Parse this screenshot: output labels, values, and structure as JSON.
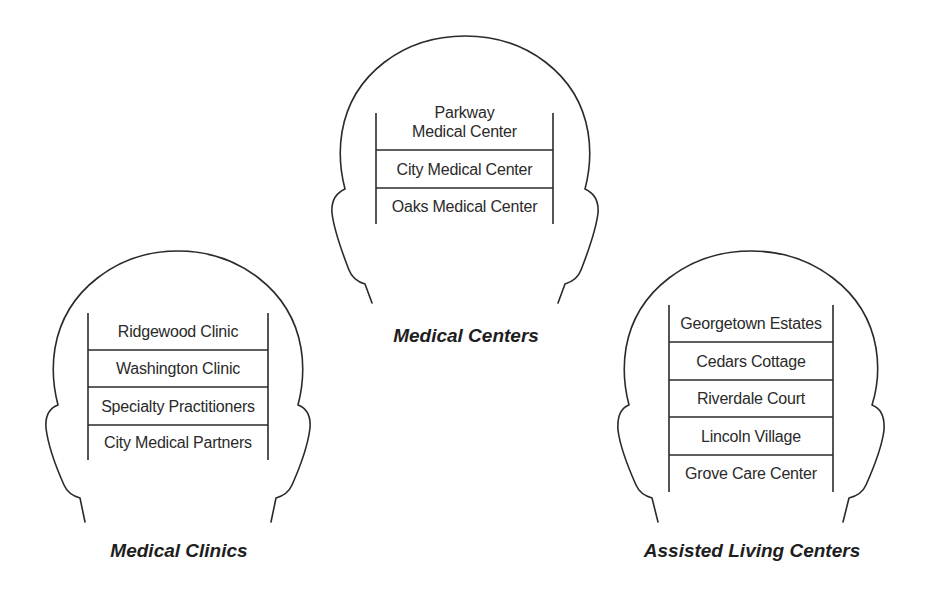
{
  "diagram": {
    "groups": [
      {
        "id": "medical-centers",
        "label": "Medical Centers",
        "items": [
          "Parkway\nMedical Center",
          "City Medical Center",
          "Oaks Medical Center"
        ]
      },
      {
        "id": "medical-clinics",
        "label": "Medical Clinics",
        "items": [
          "Ridgewood Clinic",
          "Washington Clinic",
          "Specialty Practitioners",
          "City Medical Partners"
        ]
      },
      {
        "id": "assisted-living-centers",
        "label": "Assisted Living Centers",
        "items": [
          "Georgetown Estates",
          "Cedars Cottage",
          "Riverdale Court",
          "Lincoln Village",
          "Grove Care Center"
        ]
      }
    ]
  }
}
